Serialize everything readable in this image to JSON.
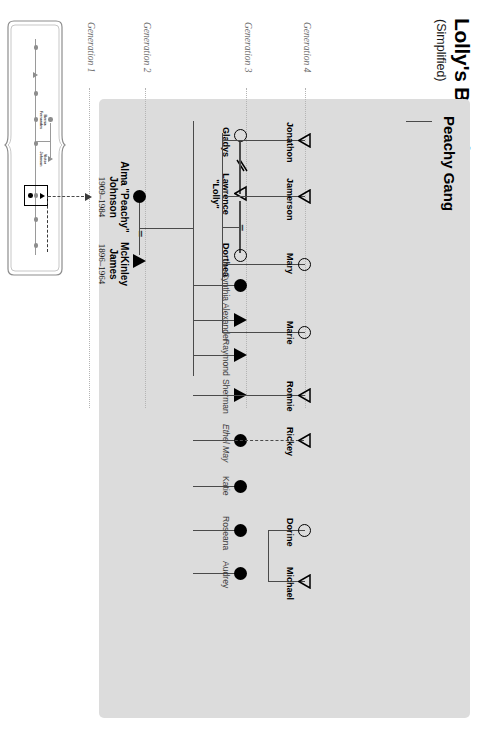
{
  "title": "Lolly's Branch",
  "subtitle": "(Simplified)",
  "panel_label": "Peachy Gang",
  "colors": {
    "panel_bg": "#dcdcdc",
    "line": "#4a4a4a",
    "symbol_fill": "#000000",
    "gen_label": "#6b6b6b",
    "page_bg": "#ffffff"
  },
  "generations": [
    {
      "label": "Generation 1"
    },
    {
      "label": "Generation 2"
    },
    {
      "label": "Generation 3"
    },
    {
      "label": "Generation 4"
    }
  ],
  "generation2": {
    "mother": {
      "name_line1": "Alma \"Peachy\"",
      "name_line2": "Johnson",
      "dates": "1909–1984",
      "symbol": "filled-circle"
    },
    "union_symbol": "=",
    "father": {
      "name_line1": "McKinley",
      "name_line2": "James",
      "dates": "1896–1964",
      "symbol": "filled-triangle"
    }
  },
  "couple": {
    "gladys": {
      "name": "Gladys",
      "symbol": "open-circle"
    },
    "divorce_symbol": "divorce-slash",
    "lawrence": {
      "name_line1": "Lawrence",
      "name_line2": "\"Lolly\"",
      "symbol": "open-triangle"
    },
    "union_symbol": "=",
    "dorthea": {
      "name": "Dorthea",
      "symbol": "open-circle"
    }
  },
  "generation3": [
    {
      "name": "Cynthia",
      "symbol": "filled-circle"
    },
    {
      "name": "Alexander",
      "symbol": "filled-triangle"
    },
    {
      "name": "Raymond",
      "symbol": "filled-triangle"
    },
    {
      "name": "Sherman",
      "symbol": "filled-triangle"
    },
    {
      "name": "Ethel May",
      "symbol": "filled-circle"
    },
    {
      "name": "Katie",
      "symbol": "filled-circle"
    },
    {
      "name": "Roseana",
      "symbol": "filled-circle"
    },
    {
      "name": "Audrey",
      "symbol": "filled-circle"
    }
  ],
  "generation4": [
    {
      "name": "Jonathon",
      "symbol": "open-triangle"
    },
    {
      "name": "Jamerson",
      "symbol": "open-triangle"
    },
    {
      "name": "Mary",
      "symbol": "open-circle"
    },
    {
      "name": "Marie",
      "symbol": "open-circle"
    },
    {
      "name": "Ronnie",
      "symbol": "open-triangle"
    },
    {
      "name": "Rickey",
      "symbol": "open-triangle"
    },
    {
      "name": "Dorine",
      "symbol": "open-circle"
    },
    {
      "name": "Michael",
      "symbol": "open-triangle"
    }
  ],
  "inset": {
    "person_a": {
      "name_line1": "Bernia",
      "name_line2": "Fernandes"
    },
    "person_b": {
      "name_line1": "Victor",
      "name_line2": "Johnson"
    },
    "union_symbol": "=",
    "highlight_box": "boxed-couple",
    "pointer": "dashed-arrow-to-alma"
  }
}
